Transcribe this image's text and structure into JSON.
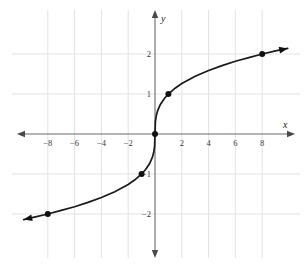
{
  "figure": {
    "title": "",
    "background_color": "#ffffff",
    "grid_color": "#e3e3e6",
    "axis_color": "#6b6b6b",
    "curve_color": "#1a1a1a",
    "point_color": "#111111"
  },
  "axes": {
    "x_axis_label": "x",
    "y_axis_label": "y",
    "x_tick_labels": [
      "−8",
      "−6",
      "−4",
      "−2",
      "2",
      "4",
      "6",
      "8"
    ],
    "x_tick_values": [
      -8,
      -6,
      -4,
      -2,
      2,
      4,
      6,
      8
    ],
    "y_tick_labels": [
      "2",
      "1",
      "−1",
      "−2"
    ],
    "y_tick_values": [
      2,
      1,
      -1,
      -2
    ],
    "xlim": [
      -10.1,
      10.3
    ],
    "ylim": [
      -2.85,
      2.45
    ],
    "grid": true,
    "arrows": [
      "x-left",
      "x-right",
      "y-up",
      "y-down"
    ]
  },
  "chart_data": {
    "type": "line",
    "title": "",
    "xlabel": "x",
    "ylabel": "y",
    "grid": true,
    "legend": "none",
    "xlim": [
      -10.1,
      10.3
    ],
    "ylim": [
      -2.85,
      2.45
    ],
    "function": "y = cbrt(x)",
    "series": [
      {
        "name": "y = ∛ x",
        "x": [
          -9.8,
          -9.0,
          -8.0,
          -7.0,
          -6.0,
          -5.0,
          -4.0,
          -3.0,
          -2.0,
          -1.5,
          -1.0,
          -0.7,
          -0.4,
          -0.2,
          -0.1,
          -0.03,
          0,
          0.03,
          0.1,
          0.2,
          0.4,
          0.7,
          1.0,
          1.5,
          2.0,
          3.0,
          4.0,
          5.0,
          6.0,
          7.0,
          8.0,
          9.0,
          9.9
        ],
        "y": [
          -2.14,
          -2.08,
          -2.0,
          -1.91,
          -1.82,
          -1.71,
          -1.587,
          -1.442,
          -1.26,
          -1.145,
          -1.0,
          -0.888,
          -0.737,
          -0.585,
          -0.464,
          -0.311,
          0,
          0.311,
          0.464,
          0.585,
          0.737,
          0.888,
          1.0,
          1.145,
          1.26,
          1.442,
          1.587,
          1.71,
          1.82,
          1.91,
          2.0,
          2.08,
          2.14
        ]
      }
    ],
    "marked_points": [
      {
        "label": "(-8, -2)",
        "x": -8,
        "y": -2
      },
      {
        "label": "(-1, -1)",
        "x": -1,
        "y": -1
      },
      {
        "label": "(0, 0)",
        "x": 0,
        "y": 0
      },
      {
        "label": "(1, 1)",
        "x": 1,
        "y": 1
      },
      {
        "label": "(8, 2)",
        "x": 8,
        "y": 2
      }
    ]
  }
}
